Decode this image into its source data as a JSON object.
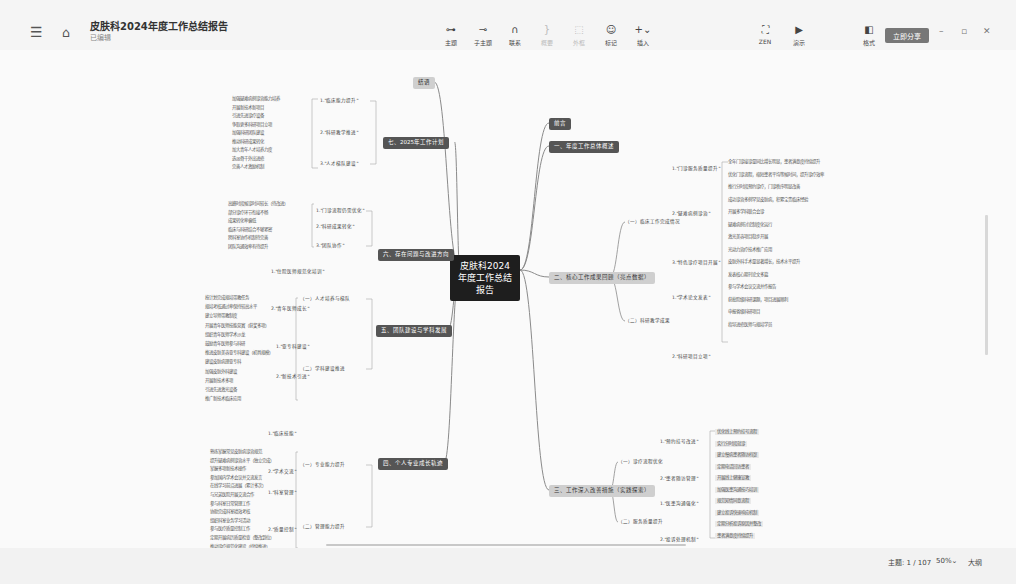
{
  "header": {
    "title": "皮肤科2024年度工作总结报告",
    "status": "已编辑",
    "menu_icon": "menu-icon",
    "home_icon": "home-icon"
  },
  "toolbar": {
    "tools": [
      {
        "label": "主题",
        "icon": "topic-icon",
        "glyph": "⊶",
        "disabled": false
      },
      {
        "label": "子主题",
        "icon": "subtopic-icon",
        "glyph": "⊸",
        "disabled": false
      },
      {
        "label": "联系",
        "icon": "relation-icon",
        "glyph": "∩",
        "disabled": false
      },
      {
        "label": "概要",
        "icon": "summary-icon",
        "glyph": "}",
        "disabled": true
      },
      {
        "label": "外框",
        "icon": "boundary-icon",
        "glyph": "⬚",
        "disabled": true
      },
      {
        "label": "标记",
        "icon": "marker-icon",
        "glyph": "☺",
        "disabled": false
      },
      {
        "label": "插入",
        "icon": "insert-icon",
        "glyph": "+⌄",
        "disabled": false
      }
    ],
    "right_tools": [
      {
        "label": "ZEN",
        "icon": "fullscreen-icon",
        "glyph": "⛶"
      },
      {
        "label": "演示",
        "icon": "present-icon",
        "glyph": "▶"
      }
    ],
    "style_tool": {
      "label": "格式",
      "icon": "format-panel-icon",
      "glyph": "◧"
    },
    "share_label": "立即分享",
    "window": {
      "minimize": "–",
      "restore": "▫",
      "close": "✕"
    }
  },
  "mindmap": {
    "root": "皮肤科2024年度工作总结报告",
    "right_main": [
      {
        "label": "前言",
        "style": "dark"
      },
      {
        "label": "一、年度工作总体概述",
        "style": "dark"
      },
      {
        "label": "二、核心工作成果回顾（亮点数据）",
        "style": "light"
      },
      {
        "label": "三、工作深入改善措施（实践探索）",
        "style": "light"
      }
    ],
    "left_main": [
      {
        "label": "结语",
        "style": "light"
      },
      {
        "label": "七、2025年工作计划",
        "style": "dark"
      },
      {
        "label": "六、存在问题与改进方向",
        "style": "dark"
      },
      {
        "label": "五、团队建设与学科发展",
        "style": "dark"
      },
      {
        "label": "四、个人专业成长轨迹",
        "style": "dark"
      }
    ],
    "right_sub": [
      {
        "label": "（一）临床工作完成情况"
      },
      {
        "label": "1.\"门诊服务质量提升\""
      },
      {
        "label": "2.\"疑难病例诊治\""
      },
      {
        "label": "3.\"特色诊疗项目开展\""
      },
      {
        "label": "（二）科研教学成果"
      },
      {
        "label": "1.\"学术论文发表\""
      },
      {
        "label": "2.\"科研项目立项\""
      },
      {
        "label": "（一）诊疗流程优化"
      },
      {
        "label": "1.\"预约挂号改进\""
      },
      {
        "label": "2.\"患者随访管理\""
      },
      {
        "label": "（二）服务质量提升"
      },
      {
        "label": "1.\"医患沟通强化\""
      },
      {
        "label": "2.\"投诉处理机制\""
      }
    ],
    "right_leaves": [
      "全年门诊接诊量同比增长明显，患者满意度持续提升",
      "优化门诊流程，缩短患者平均等候时间，提升诊疗效率",
      "推行分时段预约诊疗，门诊秩序明显改善",
      "成功诊治多例罕见皮肤病，积累宝贵临床经验",
      "开展多学科联合会诊",
      "疑难病例讨论制度化运行",
      "激光美容项目稳步开展",
      "光动力治疗技术推广应用",
      "皮肤外科手术量显著增长，技术水平提升",
      "发表核心期刊论文多篇",
      "参与学术会议交流并作报告",
      "获批院级科研课题，项目进展顺利",
      "申报省级科研项目",
      "指导进修医师与规培学员",
      "优化线上预约挂号流程",
      "实行分时段就诊",
      "建立慢病患者随访档案",
      "定期电话回访患者",
      "开展线上健康宣教",
      "加强医患沟通技巧培训",
      "规范知情同意流程",
      "建立投诉快速响应机制",
      "定期分析投诉原因并整改",
      "患者满意度持续提升"
    ],
    "left_sub": [
      "1.\"临床能力提升\"",
      "2.\"科研教学推进\"",
      "3.\"人才梯队建设\"",
      "1.\"门诊流程仍需优化\"",
      "2.\"科研成果转化\"",
      "3.\"团队协作\"",
      "（一）人才培养与梯队",
      "1.\"住院医师规范化培训\"",
      "2.\"青年医师成长\"",
      "（二）学科建设推进",
      "1.\"亚专科建设\"",
      "2.\"新技术引进\"",
      "（一）专业能力提升",
      "1.\"临床技能\"",
      "2.\"学术交流\"",
      "（二）管理能力提升",
      "1.\"科室管理\"",
      "2.\"质量控制\""
    ],
    "left_leaves": [
      "加强疑难病例诊治能力培养",
      "开展新技术新项目",
      "引进先进诊疗设备",
      "争取更多科研项目立项",
      "加强科研团队建设",
      "推动科研成果转化",
      "加大青年人才培养力度",
      "选派骨干外出进修",
      "完善人才激励机制",
      "高峰时段候诊时间较长（待改进）",
      "部分诊疗环节衔接不畅",
      "成果转化率偏低",
      "临床与科研结合不够紧密",
      "跨科室协作机制待完善",
      "团队沟通效率有待提升",
      "按计划完成规培带教任务",
      "规培考核通过率保持较高水平",
      "建立导师带教制度",
      "开展青年医师技能竞赛（获奖多项）",
      "组织青年医师学术沙龙",
      "鼓励青年医师参与科研",
      "推进皮肤美容亚专科建设（初具规模）",
      "建设皮肤病理亚专科",
      "加强皮肤外科建设",
      "开展新技术多项",
      "引进先进激光设备",
      "推广新技术临床应用",
      "熟练掌握常见皮肤病诊治规范",
      "提升疑难病例诊治水平（独立完成）",
      "掌握多项新技术操作",
      "参加国内学术会议并交流发言",
      "在线学习前沿进展（累计多次）",
      "与兄弟医院开展交流合作",
      "参与科室日常管理工作",
      "协助完成科室绩效考核",
      "组织科室业务学习活动",
      "参与医疗质量控制工作",
      "定期开展病历质量检查（整改到位）",
      "推动诊疗规范化建设（持续推进）"
    ]
  },
  "statusbar": {
    "topic_count": "主题: 1 / 107",
    "zoom": "50%⌄",
    "outline": "大纲"
  }
}
